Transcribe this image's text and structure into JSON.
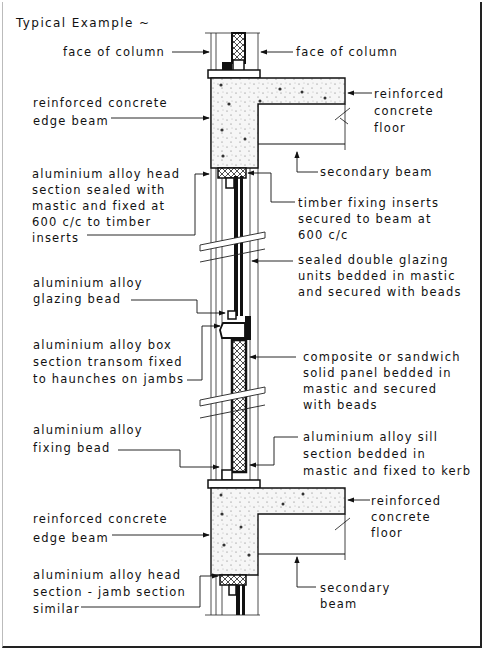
{
  "title": "Typical Example ~",
  "labels": {
    "face_of_column_left": "face of column",
    "face_of_column_right": "face of column",
    "rc_edge_beam_top": "reinforced concrete\nedge beam",
    "rc_floor_top": "reinforced\nconcrete\nfloor",
    "secondary_beam_top": "secondary beam",
    "al_head_section": "aluminium alloy head\nsection sealed with\nmastic and fixed at\n600 c/c to timber\ninserts",
    "timber_fixing_inserts": "timber fixing inserts\nsecured to beam at\n600 c/c",
    "sealed_double_glazing": "sealed double glazing\nunits bedded in mastic\nand secured with beads",
    "al_glazing_bead": "aluminium alloy\nglazing bead",
    "al_box_transom": "aluminium alloy box\nsection transom fixed\nto haunches on jambs",
    "composite_panel": "composite or sandwich\nsolid panel bedded in\nmastic and secured\nwith beads",
    "al_fixing_bead": "aluminium alloy\nfixing bead",
    "al_sill_section": "aluminium alloy sill\nsection bedded in\nmastic and fixed to kerb",
    "rc_edge_beam_bottom": "reinforced concrete\nedge beam",
    "rc_floor_bottom": "reinforced\nconcrete\nfloor",
    "al_head_jamb_bottom": "aluminium alloy head\nsection - jamb section\nsimilar",
    "secondary_beam_bottom": "secondary\nbeam"
  },
  "colors": {
    "ink": "#111111",
    "paper": "#ffffff",
    "concrete_fill": "#f4f4f4"
  }
}
